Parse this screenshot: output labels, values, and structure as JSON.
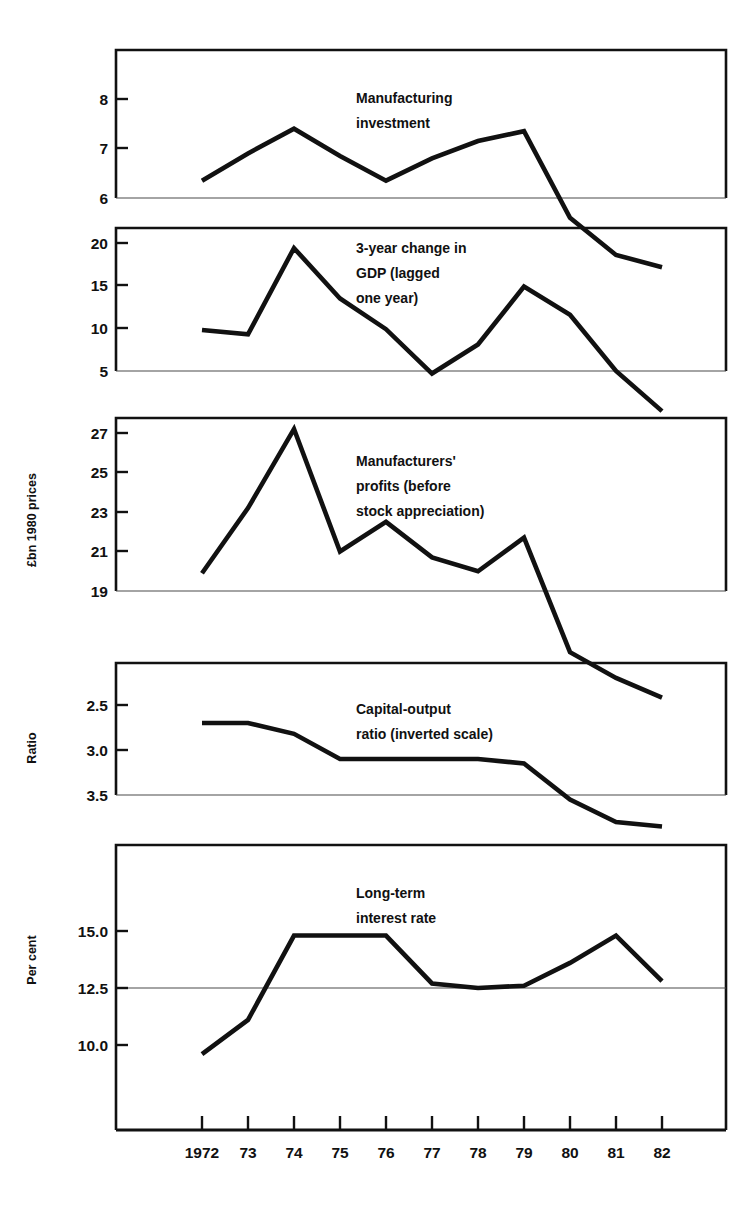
{
  "header": {
    "running_head": ""
  },
  "chart_data": {
    "type": "line",
    "title": "",
    "subtitle": "",
    "xlabel": "",
    "grid": "horizontal reference line at one level per panel",
    "legend": "none (inline annotations on each panel)",
    "x": [
      1972,
      1973,
      1974,
      1975,
      1976,
      1977,
      1978,
      1979,
      1980,
      1981,
      1982
    ],
    "x_tick_labels": [
      "1972",
      "73",
      "74",
      "75",
      "76",
      "77",
      "78",
      "79",
      "80",
      "81",
      "82"
    ],
    "panels": [
      {
        "id": "manufacturing-investment",
        "annotation": "Manufacturing\ninvestment",
        "annotation_lines": [
          "Manufacturing",
          "investment"
        ],
        "ylabel_group": "£bn 1980 prices",
        "y_tick_labels": [
          "8",
          "7",
          "6"
        ],
        "y_ticks": [
          8,
          7,
          6
        ],
        "ylim": [
          4.4,
          8.8
        ],
        "gridline_at": 6,
        "inverted": false,
        "values": [
          6.35,
          6.9,
          7.4,
          6.85,
          6.35,
          6.8,
          7.15,
          7.35,
          5.6,
          4.85,
          4.6
        ]
      },
      {
        "id": "gdp-3-year-change",
        "annotation": "3-year change in GDP (lagged one year)",
        "annotation_lines": [
          "3-year change in",
          "GDP (lagged",
          "one year)"
        ],
        "ylabel_group": "£bn 1980 prices",
        "y_tick_labels": [
          "20",
          "15",
          "10",
          "5"
        ],
        "y_ticks": [
          20,
          15,
          10,
          5
        ],
        "ylim": [
          2.0,
          23.0
        ],
        "gridline_at": 5,
        "inverted": false,
        "values": [
          9.8,
          9.3,
          19.4,
          13.5,
          9.9,
          4.7,
          8.1,
          14.9,
          11.6,
          5.0,
          0.3
        ]
      },
      {
        "id": "manufacturers-profits",
        "annotation": "Manufacturers' profits (before stock appreciation)",
        "annotation_lines": [
          "Manufacturers'",
          "profits (before",
          "stock appreciation)"
        ],
        "ylabel_group": "£bn 1980 prices",
        "y_tick_labels": [
          "27",
          "25",
          "23",
          "21",
          "19"
        ],
        "y_ticks": [
          27,
          25,
          23,
          21,
          19
        ],
        "ylim": [
          17.3,
          28.6
        ],
        "gridline_at": 19,
        "inverted": false,
        "values": [
          19.9,
          23.2,
          27.2,
          21.0,
          22.5,
          20.7,
          20.0,
          21.7,
          15.9,
          14.6,
          13.6
        ]
      },
      {
        "id": "capital-output-ratio",
        "annotation": "Capital-output ratio (inverted scale)",
        "annotation_lines": [
          "Capital-output",
          "ratio (inverted scale)"
        ],
        "ylabel_group": "Ratio",
        "y_tick_labels": [
          "2.5",
          "3.0",
          "3.5"
        ],
        "y_ticks": [
          2.5,
          3.0,
          3.5
        ],
        "ylim": [
          2.25,
          3.92
        ],
        "gridline_at": 3.5,
        "inverted": true,
        "values": [
          2.7,
          2.7,
          2.82,
          3.1,
          3.1,
          3.1,
          3.1,
          3.15,
          3.55,
          3.8,
          3.85
        ]
      },
      {
        "id": "long-term-interest-rate",
        "annotation": "Long-term interest rate",
        "annotation_lines": [
          "Long-term",
          "interest rate"
        ],
        "ylabel_group": "Per cent",
        "y_tick_labels": [
          "15.0",
          "12.5",
          "10.0"
        ],
        "y_ticks": [
          15.0,
          12.5,
          10.0
        ],
        "ylim": [
          8.6,
          17.1
        ],
        "gridline_at": 12.5,
        "inverted": false,
        "values": [
          9.6,
          11.1,
          14.8,
          14.8,
          14.8,
          12.7,
          12.5,
          12.6,
          13.6,
          14.8,
          12.8
        ]
      }
    ],
    "axis_group_labels": [
      {
        "text": "£bn 1980 prices",
        "orientation": "vertical"
      },
      {
        "text": "Ratio",
        "orientation": "vertical"
      },
      {
        "text": "Per cent",
        "orientation": "vertical"
      }
    ],
    "colors": {
      "line": "#111111",
      "frame": "#111111",
      "gridline": "#4a4a4a",
      "background": "#ffffff"
    }
  }
}
